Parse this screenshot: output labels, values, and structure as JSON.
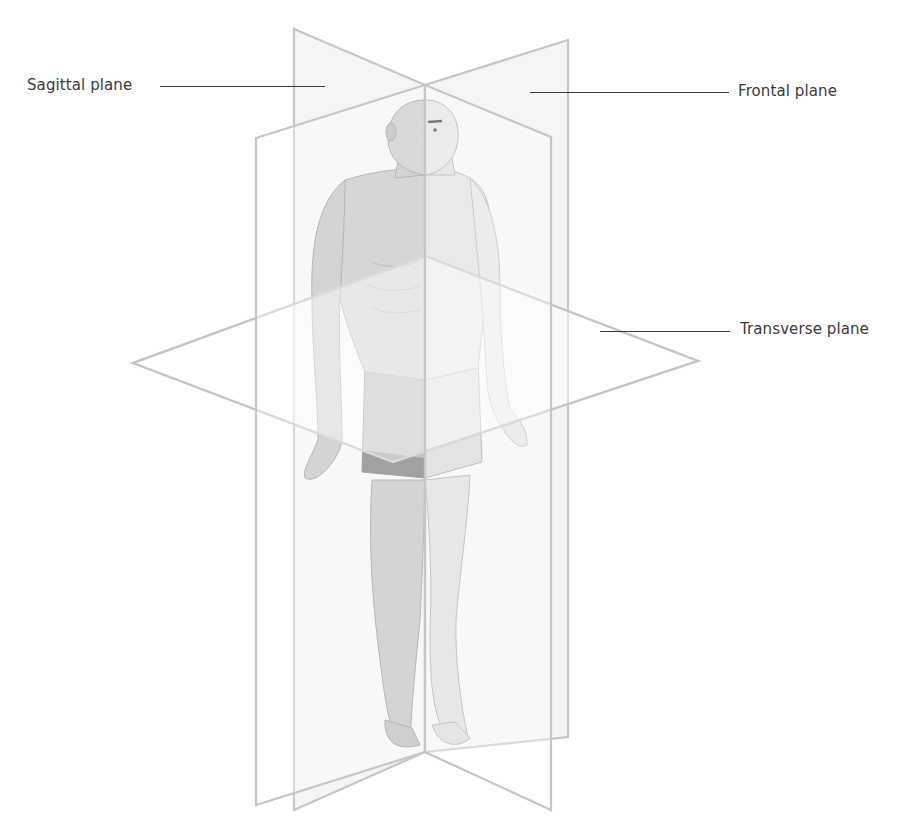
{
  "figure": {
    "labels": [
      {
        "id": "sagittal",
        "text": "Sagittal plane"
      },
      {
        "id": "frontal",
        "text": "Frontal plane"
      },
      {
        "id": "transverse",
        "text": "Transverse plane"
      }
    ]
  },
  "colors": {
    "plane_edge": "#c4c4c4",
    "plane_fill": "#f3f3f3",
    "skin_light": "#dcdcdc",
    "skin_mid": "#c2c2c2",
    "skin_dark": "#a9a9a9",
    "shorts": "#707070",
    "label_text": "#3a3a3a"
  }
}
